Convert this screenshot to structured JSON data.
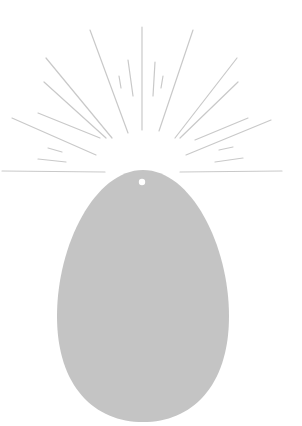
{
  "illustration": {
    "subject": "egg-with-radiating-rays",
    "colors": {
      "background": "#ffffff",
      "egg_fill": "#c4c4c4",
      "ray_stroke": "#c9c9c9",
      "hole_fill": "#ffffff"
    },
    "egg": {
      "cx": 143,
      "top": 170,
      "bottom": 422,
      "left": 57,
      "right": 229
    },
    "hole": {
      "cx": 142,
      "cy": 182,
      "r": 3.2
    },
    "rays": [
      [
        142,
        27,
        142,
        130
      ],
      [
        90,
        30,
        128,
        133
      ],
      [
        46,
        58,
        112,
        138
      ],
      [
        44,
        82,
        106,
        138
      ],
      [
        12,
        118,
        96,
        155
      ],
      [
        38,
        113,
        100,
        138
      ],
      [
        119,
        76,
        121,
        88
      ],
      [
        128,
        60,
        133,
        96
      ],
      [
        193,
        30,
        159,
        131
      ],
      [
        237,
        58,
        175,
        138
      ],
      [
        238,
        82,
        180,
        138
      ],
      [
        271,
        120,
        186,
        155
      ],
      [
        248,
        118,
        195,
        140
      ],
      [
        155,
        62,
        153,
        96
      ],
      [
        163,
        76,
        161,
        88
      ],
      [
        2,
        171,
        105,
        172
      ],
      [
        180,
        172,
        282,
        171
      ],
      [
        48,
        148,
        62,
        152
      ],
      [
        38,
        159,
        66,
        162
      ],
      [
        219,
        150,
        233,
        147
      ],
      [
        215,
        162,
        243,
        158
      ]
    ]
  }
}
